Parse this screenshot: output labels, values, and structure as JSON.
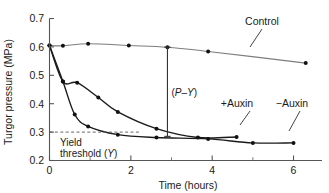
{
  "chart_data": {
    "type": "line",
    "title": "",
    "xlabel": "Time (hours)",
    "ylabel": "Turgor pressure (MPa)",
    "xlim": [
      0,
      6.7
    ],
    "ylim": [
      0.2,
      0.7
    ],
    "xticks": [
      0,
      2,
      4,
      6
    ],
    "xtick_labels": [
      "0",
      "2",
      "4",
      "6"
    ],
    "xminorticks": [
      1,
      3,
      5
    ],
    "yticks": [
      0.2,
      0.3,
      0.4,
      0.5,
      0.6,
      0.7
    ],
    "ytick_labels": [
      "0.2",
      "0.3",
      "0.4",
      "0.5",
      "0.6",
      "0.7"
    ],
    "grid": false,
    "legend": "inline-annotations",
    "series": [
      {
        "name": "Control",
        "color": "#7d7d7d",
        "marker": "filled-circle",
        "x": [
          0.0,
          0.33,
          0.95,
          1.95,
          2.9,
          3.9,
          6.3
        ],
        "y": [
          0.605,
          0.604,
          0.611,
          0.605,
          0.599,
          0.584,
          0.543
        ]
      },
      {
        "name": "+Auxin",
        "color": "#1a1a1a",
        "marker": "filled-circle",
        "x": [
          0.0,
          0.33,
          0.68,
          1.2,
          1.68,
          2.63,
          3.65,
          4.6
        ],
        "y": [
          0.605,
          0.478,
          0.474,
          0.422,
          0.371,
          0.312,
          0.281,
          0.283
        ]
      },
      {
        "name": "−Auxin",
        "color": "#1a1a1a",
        "marker": "filled-circle",
        "x": [
          0.0,
          0.33,
          0.62,
          0.95,
          1.68,
          2.63,
          3.9,
          5.0,
          6.0
        ],
        "y": [
          0.605,
          0.478,
          0.362,
          0.32,
          0.291,
          0.281,
          0.276,
          0.262,
          0.262
        ]
      }
    ],
    "annotations": [
      {
        "name": "yield-threshold",
        "text_line1": "Yield",
        "text_line2_prefix": "threshold (",
        "text_line2_italic": "Y",
        "text_line2_suffix": ")",
        "dashed_y": 0.3,
        "dashed_x_from": 0.0,
        "dashed_x_to": 2.2
      },
      {
        "name": "p-minus-y",
        "text_prefix": "(",
        "text_italic_1": "P",
        "text_dash": "–",
        "text_italic_2": "Y",
        "text_suffix": ")",
        "bar_x": 2.9,
        "bar_y_top": 0.599,
        "bar_y_bottom": 0.285
      }
    ],
    "series_labels": [
      {
        "name": "Control",
        "text": "Control",
        "x_px": 262,
        "y_px": 25
      },
      {
        "name": "+Auxin",
        "text": "+Auxin",
        "x_px": 237,
        "y_px": 107
      },
      {
        "name": "-Auxin",
        "text": "−Auxin",
        "x_px": 292,
        "y_px": 107
      }
    ]
  }
}
